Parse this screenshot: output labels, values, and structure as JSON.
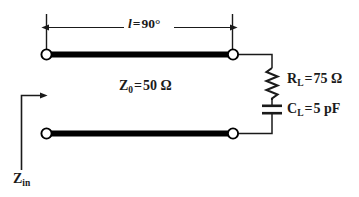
{
  "figure": {
    "name": "transmission-line-with-rc-load",
    "background_color": "#ffffff",
    "line_color": "#1a1a1a",
    "conductor_color": "#000000",
    "node_fill_color": "#ffffff",
    "width": 359,
    "height": 197
  },
  "labels": {
    "length": {
      "symbol": "l",
      "operator": "=",
      "value": "90",
      "unit": "°",
      "full": "l = 90°"
    },
    "characteristic_impedance": {
      "symbol": "Z",
      "subscript": "0",
      "operator": "=",
      "value": "50",
      "unit": "Ω",
      "full": "Z0 = 50 Ω"
    },
    "load_resistance": {
      "symbol": "R",
      "subscript": "L",
      "operator": "=",
      "value": "75",
      "unit": "Ω",
      "full": "RL = 75 Ω"
    },
    "load_capacitance": {
      "symbol": "C",
      "subscript": "L",
      "operator": "=",
      "value": "5",
      "unit": "pF",
      "full": "CL = 5 pF"
    },
    "input_impedance": {
      "symbol": "Z",
      "subscript": "in",
      "full": "Zin"
    }
  },
  "components": {
    "resistor": {
      "icon": "resistor-zigzag-icon",
      "orientation": "vertical"
    },
    "capacitor": {
      "icon": "capacitor-parallel-plate-icon",
      "orientation": "vertical"
    },
    "nodes": [
      {
        "name": "top-left-terminal"
      },
      {
        "name": "top-right-terminal"
      },
      {
        "name": "bottom-left-terminal"
      },
      {
        "name": "bottom-right-terminal"
      }
    ],
    "dimension": {
      "name": "length-dimension-arrow",
      "style": "double-headed"
    },
    "input_arrow": {
      "name": "input-impedance-arrow",
      "style": "elbow-right"
    }
  }
}
